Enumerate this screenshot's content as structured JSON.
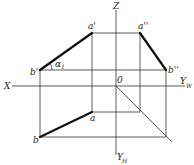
{
  "diagram": {
    "axes": {
      "x": "X",
      "z": "Z",
      "origin": "0",
      "yw": "Y",
      "yw_sub": "W",
      "yh": "Y",
      "yh_sub": "H"
    },
    "points": {
      "a_front": "a'",
      "b_front": "b'",
      "a_side": "a''",
      "b_side": "b''",
      "a_top": "a",
      "b_top": "b"
    },
    "angle": {
      "symbol": "α",
      "sub": "1"
    }
  }
}
